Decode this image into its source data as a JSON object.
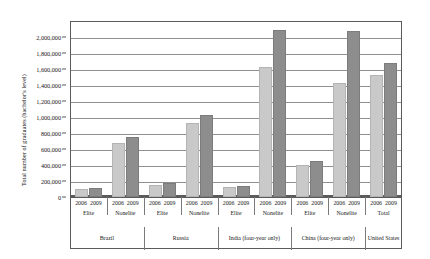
{
  "chart_data": {
    "type": "bar",
    "title": "",
    "xlabel": "",
    "ylabel": "Total number of graduates (bachelor's level)",
    "ylim": [
      0,
      2200000
    ],
    "ytick_step": 200000,
    "grid": true,
    "legend_position": "none",
    "ytick_labels": [
      "2,200,000",
      "2,000,000",
      "1,800,000",
      "1,600,000",
      "1,400,000",
      "1,200,000",
      "1,000,000",
      "800,000",
      "600,000",
      "400,000",
      "200,000",
      "0"
    ],
    "ytick_values": [
      2200000,
      2000000,
      1800000,
      1600000,
      1400000,
      1200000,
      1000000,
      800000,
      600000,
      400000,
      200000,
      0
    ],
    "categories": [
      {
        "country": "Brazil",
        "tier": "Elite"
      },
      {
        "country": "Brazil",
        "tier": "Nonelite"
      },
      {
        "country": "Russia",
        "tier": "Elite"
      },
      {
        "country": "Russia",
        "tier": "Nonelite"
      },
      {
        "country": "India (four-year only)",
        "tier": "Elite"
      },
      {
        "country": "India (four-year only)",
        "tier": "Nonelite"
      },
      {
        "country": "China (four-year only)",
        "tier": "Elite"
      },
      {
        "country": "China (four-year only)",
        "tier": "Nonelite"
      },
      {
        "country": "United States",
        "tier": "Total"
      }
    ],
    "country_bands": [
      {
        "label": "Brazil",
        "span": 2
      },
      {
        "label": "Russia",
        "span": 2
      },
      {
        "label": "India (four-year only)",
        "span": 2
      },
      {
        "label": "China (four-year only)",
        "span": 2
      },
      {
        "label": "United States",
        "span": 1
      }
    ],
    "series": [
      {
        "name": "2006",
        "color": "#c9c9c9",
        "values": [
          75000,
          645000,
          130000,
          900000,
          95000,
          1600000,
          380000,
          1400000,
          1500000
        ]
      },
      {
        "name": "2009",
        "color": "#8d8d8d",
        "values": [
          90000,
          730000,
          155000,
          1000000,
          115000,
          2060000,
          420000,
          2050000,
          1655000
        ]
      }
    ]
  }
}
